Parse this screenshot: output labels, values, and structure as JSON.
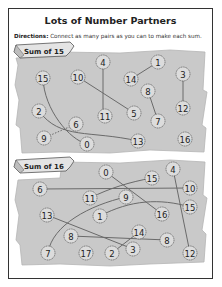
{
  "worksheet": {
    "title": "Lots of Number Partners",
    "directions_label": "Directions:",
    "directions_text": " Connect as many pairs as you can to make each sum."
  },
  "colors": {
    "parchment": "#c9c9c9",
    "parchment_edge": "#b5b5b5",
    "line": "#6a6a6a",
    "circle_fill": "#dcdcdc",
    "circle_stroke": "#555555",
    "border": "#333333"
  },
  "sections": [
    {
      "id": "sum-15",
      "banner": "Sum of 15",
      "target_sum": 15,
      "numbers": [
        {
          "id": "a15",
          "value": "15",
          "x": 43,
          "y": 78
        },
        {
          "id": "a10",
          "value": "10",
          "x": 78,
          "y": 77
        },
        {
          "id": "a4",
          "value": "4",
          "x": 103,
          "y": 62
        },
        {
          "id": "a14",
          "value": "14",
          "x": 131,
          "y": 79
        },
        {
          "id": "a1",
          "value": "1",
          "x": 158,
          "y": 62
        },
        {
          "id": "a3",
          "value": "3",
          "x": 183,
          "y": 74
        },
        {
          "id": "a8",
          "value": "8",
          "x": 148,
          "y": 91
        },
        {
          "id": "a12",
          "value": "12",
          "x": 183,
          "y": 108
        },
        {
          "id": "a11",
          "value": "11",
          "x": 105,
          "y": 116
        },
        {
          "id": "a5",
          "value": "5",
          "x": 134,
          "y": 113
        },
        {
          "id": "a7",
          "value": "7",
          "x": 158,
          "y": 121
        },
        {
          "id": "a2",
          "value": "2",
          "x": 39,
          "y": 111
        },
        {
          "id": "a6",
          "value": "6",
          "x": 76,
          "y": 124
        },
        {
          "id": "a9",
          "value": "9",
          "x": 44,
          "y": 138
        },
        {
          "id": "a0",
          "value": "0",
          "x": 87,
          "y": 144
        },
        {
          "id": "a13",
          "value": "13",
          "x": 138,
          "y": 141
        },
        {
          "id": "a16",
          "value": "16",
          "x": 185,
          "y": 139
        }
      ],
      "connections": [
        {
          "from": "a4",
          "to": "a11",
          "path": "M103,62 L103,116"
        },
        {
          "from": "a10",
          "to": "a5",
          "path": "M78,77 L134,113"
        },
        {
          "from": "a14",
          "to": "a1",
          "path": "M131,79 L158,62"
        },
        {
          "from": "a8",
          "to": "a7",
          "path": "M148,91 L158,121"
        },
        {
          "from": "a3",
          "to": "a12",
          "path": "M183,74 L183,108"
        },
        {
          "from": "a15",
          "to": "a0",
          "path": "M43,78 C44,110 70,140 87,144"
        },
        {
          "from": "a2",
          "to": "a13",
          "path": "M39,111 C60,140 90,130 138,141"
        },
        {
          "from": "a9",
          "to": "a6",
          "path": "M44,138 L76,124",
          "dashed": true
        }
      ]
    },
    {
      "id": "sum-16",
      "banner": "Sum of 16",
      "target_sum": 16,
      "numbers": [
        {
          "id": "b0",
          "value": "0",
          "x": 106,
          "y": 172
        },
        {
          "id": "b15a",
          "value": "15",
          "x": 152,
          "y": 178
        },
        {
          "id": "b4",
          "value": "4",
          "x": 173,
          "y": 169
        },
        {
          "id": "b6",
          "value": "6",
          "x": 40,
          "y": 189
        },
        {
          "id": "b10",
          "value": "10",
          "x": 190,
          "y": 188
        },
        {
          "id": "b11",
          "value": "11",
          "x": 90,
          "y": 198
        },
        {
          "id": "b9",
          "value": "9",
          "x": 126,
          "y": 197
        },
        {
          "id": "b15b",
          "value": "15",
          "x": 190,
          "y": 207
        },
        {
          "id": "b13",
          "value": "13",
          "x": 47,
          "y": 215
        },
        {
          "id": "b1",
          "value": "1",
          "x": 100,
          "y": 216
        },
        {
          "id": "b16",
          "value": "16",
          "x": 162,
          "y": 214
        },
        {
          "id": "b14",
          "value": "14",
          "x": 139,
          "y": 232
        },
        {
          "id": "b8a",
          "value": "8",
          "x": 71,
          "y": 236
        },
        {
          "id": "b8b",
          "value": "8",
          "x": 167,
          "y": 240
        },
        {
          "id": "b3",
          "value": "3",
          "x": 133,
          "y": 249
        },
        {
          "id": "b7",
          "value": "7",
          "x": 48,
          "y": 253
        },
        {
          "id": "b17",
          "value": "17",
          "x": 86,
          "y": 253
        },
        {
          "id": "b2",
          "value": "2",
          "x": 112,
          "y": 253
        },
        {
          "id": "b12",
          "value": "12",
          "x": 190,
          "y": 253
        }
      ],
      "connections": [
        {
          "from": "b6",
          "to": "b10",
          "path": "M40,189 L190,188"
        },
        {
          "from": "b0",
          "to": "b16",
          "path": "M106,172 L162,214"
        },
        {
          "from": "b11",
          "to": "b15a",
          "path": "M90,198 C110,188 130,182 152,178"
        },
        {
          "from": "b1",
          "to": "b15b",
          "path": "M100,216 C130,200 160,198 190,207"
        },
        {
          "from": "b9",
          "to": "b7",
          "path": "M126,197 C90,205 52,225 48,253"
        },
        {
          "from": "b13",
          "to": "b3",
          "path": "M47,215 L133,249"
        },
        {
          "from": "b8a",
          "to": "b8b",
          "path": "M71,236 L167,240"
        },
        {
          "from": "b14",
          "to": "b2",
          "path": "M139,232 L112,253"
        },
        {
          "from": "b4",
          "to": "b12",
          "path": "M173,169 L190,253"
        }
      ]
    }
  ]
}
